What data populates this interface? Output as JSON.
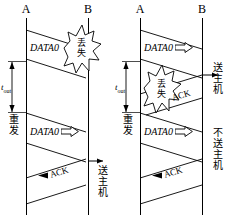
{
  "diagram": {
    "colors": {
      "line": "#000000",
      "background": "#ffffff"
    },
    "panels": [
      {
        "id": "left",
        "host_left_label": "A",
        "host_right_label": "B",
        "messages": [
          {
            "id": "data0-first",
            "label": "DATA0",
            "direction": "right",
            "has_hollow_arrow": false,
            "outcome": "lost"
          },
          {
            "id": "data0-retx",
            "label": "DATA0",
            "direction": "right",
            "has_hollow_arrow": true,
            "outcome": "delivered"
          },
          {
            "id": "ack-1",
            "label": "ACK",
            "direction": "left",
            "has_hollow_arrow": false,
            "outcome": "delivered"
          }
        ],
        "burst_label": "丢失",
        "timeout_label_base": "t",
        "timeout_label_sub": "out",
        "retransmit_label": "重发",
        "receiver_notes": [
          {
            "id": "deliver-1",
            "text": "送主机"
          }
        ]
      },
      {
        "id": "right",
        "host_left_label": "A",
        "host_right_label": "B",
        "messages": [
          {
            "id": "data0-first",
            "label": "DATA0",
            "direction": "right",
            "has_hollow_arrow": true,
            "outcome": "delivered"
          },
          {
            "id": "ack-lost",
            "label": "ACK",
            "direction": "left",
            "has_hollow_arrow": false,
            "outcome": "lost"
          },
          {
            "id": "data0-retx",
            "label": "DATA0",
            "direction": "right",
            "has_hollow_arrow": true,
            "outcome": "delivered-duplicate"
          },
          {
            "id": "ack-2",
            "label": "ACK",
            "direction": "left",
            "has_hollow_arrow": false,
            "outcome": "delivered"
          }
        ],
        "burst_label": "丢失",
        "timeout_label_base": "t",
        "timeout_label_sub": "out",
        "retransmit_label": "重发",
        "receiver_notes": [
          {
            "id": "deliver-1",
            "text": "送主机"
          },
          {
            "id": "discard-1",
            "text": "不送主机"
          }
        ]
      }
    ]
  }
}
